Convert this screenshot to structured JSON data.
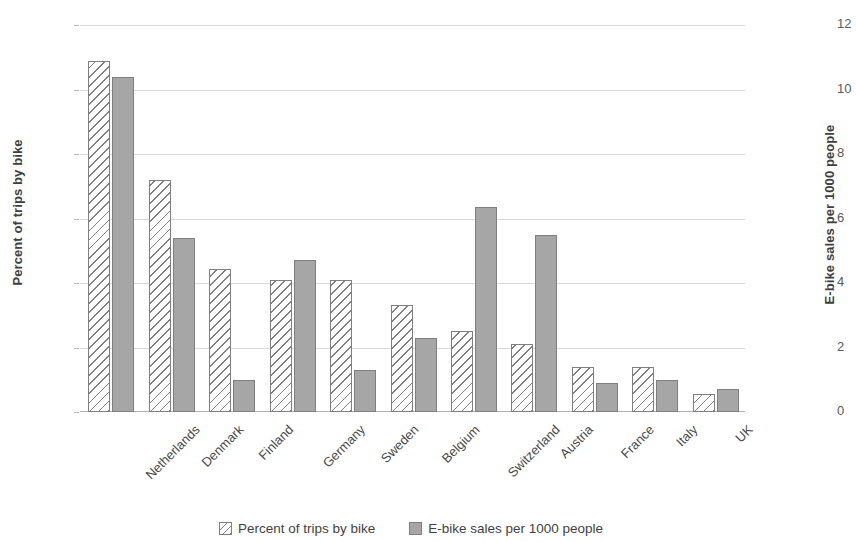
{
  "chart_data": {
    "type": "bar",
    "title": "",
    "xlabel": "",
    "ylabel": "Percent of trips by bike",
    "y2label": "E-bike sales per 1000 people",
    "grid": true,
    "legend_position": "bottom",
    "categories": [
      "Netherlands",
      "Denmark",
      "Finland",
      "Germany",
      "Sweden",
      "Belgium",
      "Switzerland",
      "Austria",
      "France",
      "Italy",
      "UK"
    ],
    "ylim": [
      0,
      30
    ],
    "yticks": [
      "0%",
      "5%",
      "10%",
      "15%",
      "20%",
      "25%",
      "30%"
    ],
    "ytick_values": [
      0,
      5,
      10,
      15,
      20,
      25,
      30
    ],
    "y2lim": [
      0,
      12
    ],
    "y2ticks": [
      "0",
      "2",
      "4",
      "6",
      "8",
      "10",
      "12"
    ],
    "y2tick_values": [
      0,
      2,
      4,
      6,
      8,
      10,
      12
    ],
    "series": [
      {
        "name": "Percent of trips by bike",
        "axis": "left",
        "unit": "%",
        "style": "hatched",
        "color": "#ffffff",
        "edge_color": "#7f7f7f",
        "values": [
          27.2,
          18.0,
          11.1,
          10.2,
          10.2,
          8.3,
          6.3,
          5.3,
          3.5,
          3.5,
          1.4
        ]
      },
      {
        "name": "E-bike sales per 1000 people",
        "axis": "right",
        "unit": "per 1000",
        "style": "solid",
        "color": "#a6a6a6",
        "edge_color": "#7f7f7f",
        "values": [
          10.4,
          5.4,
          1.0,
          4.7,
          1.3,
          2.3,
          6.35,
          5.5,
          0.9,
          1.0,
          0.7
        ]
      }
    ]
  },
  "legend": {
    "items": [
      {
        "label": "Percent of trips by bike",
        "swatch": "hatched"
      },
      {
        "label": "E-bike sales per 1000 people",
        "swatch": "solid"
      }
    ]
  },
  "colors": {
    "gridline": "#d9d9d9",
    "axis_text": "#595959",
    "title_text": "#3f3f3f",
    "bar_solid": "#a6a6a6",
    "bar_edge": "#7f7f7f",
    "background": "#ffffff"
  }
}
